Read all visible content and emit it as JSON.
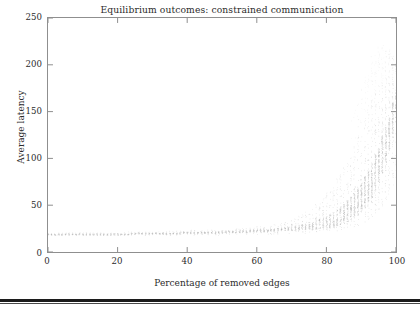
{
  "figure": {
    "title": "Equilibrium outcomes: constrained communication",
    "xlabel": "Percentage of removed edges",
    "ylabel": "Average latency"
  },
  "axes": {
    "x_ticks": [
      "0",
      "20",
      "40",
      "60",
      "80",
      "100"
    ],
    "y_ticks": [
      "0",
      "50",
      "100",
      "150",
      "200",
      "250"
    ]
  },
  "colors": {
    "marker": "#b9b9b9",
    "axis": "#8f8f8f",
    "text": "#2b2b2b",
    "background": "#ffffff",
    "page_rule": "#1c1c1c"
  },
  "chart_data": {
    "type": "scatter",
    "title": "Equilibrium outcomes: constrained communication",
    "xlabel": "Percentage of removed edges",
    "ylabel": "Average latency",
    "xlim": [
      0,
      100
    ],
    "ylim": [
      0,
      250
    ],
    "grid": false,
    "legend": null,
    "x_ticks": [
      0,
      20,
      40,
      60,
      80,
      100
    ],
    "y_ticks": [
      0,
      50,
      100,
      150,
      200,
      250
    ],
    "series": [
      {
        "name": "Average latency per instance",
        "x": [
          0,
          1,
          2,
          3,
          4,
          5,
          6,
          7,
          8,
          9,
          10,
          11,
          12,
          13,
          14,
          15,
          16,
          17,
          18,
          19,
          20,
          21,
          22,
          23,
          24,
          25,
          26,
          27,
          28,
          29,
          30,
          31,
          32,
          33,
          34,
          35,
          36,
          37,
          38,
          39,
          40,
          41,
          42,
          43,
          44,
          45,
          46,
          47,
          48,
          49,
          50,
          51,
          52,
          53,
          54,
          55,
          56,
          57,
          58,
          59,
          60,
          61,
          62,
          63,
          64,
          65,
          66,
          67,
          68,
          69,
          70,
          71,
          72,
          73,
          74,
          75,
          76,
          77,
          78,
          79,
          80,
          81,
          82,
          83,
          84,
          85,
          86,
          87,
          88,
          89,
          90,
          91,
          92,
          93,
          94,
          95,
          96,
          97,
          98,
          99,
          100
        ],
        "y_median": [
          19,
          19,
          19,
          19,
          19,
          19,
          19,
          19,
          19,
          19,
          19,
          19,
          19,
          19,
          19,
          19,
          19,
          19,
          19,
          19,
          19,
          19,
          19,
          19,
          20,
          20,
          20,
          20,
          20,
          20,
          20,
          20,
          20,
          20,
          20,
          20,
          20,
          20,
          20,
          21,
          21,
          21,
          21,
          21,
          21,
          21,
          21,
          21,
          21,
          21,
          22,
          22,
          22,
          22,
          22,
          22,
          22,
          22,
          23,
          23,
          23,
          23,
          23,
          23,
          24,
          24,
          24,
          24,
          25,
          25,
          25,
          26,
          26,
          27,
          27,
          28,
          28,
          29,
          30,
          31,
          32,
          33,
          35,
          37,
          39,
          41,
          44,
          47,
          50,
          54,
          59,
          64,
          70,
          77,
          85,
          94,
          104,
          115,
          128,
          143,
          160
        ],
        "y_low": [
          18,
          18,
          18,
          18,
          18,
          18,
          18,
          18,
          18,
          18,
          18,
          18,
          18,
          18,
          18,
          18,
          18,
          18,
          18,
          18,
          18,
          18,
          18,
          18,
          18,
          18,
          18,
          18,
          18,
          18,
          18,
          18,
          18,
          18,
          18,
          18,
          18,
          18,
          18,
          18,
          18,
          18,
          18,
          18,
          18,
          18,
          18,
          18,
          18,
          18,
          19,
          19,
          19,
          19,
          19,
          19,
          19,
          19,
          19,
          19,
          19,
          19,
          19,
          19,
          19,
          19,
          19,
          19,
          20,
          20,
          20,
          20,
          20,
          20,
          20,
          21,
          21,
          21,
          21,
          22,
          22,
          22,
          23,
          23,
          24,
          24,
          25,
          26,
          27,
          28,
          30,
          32,
          34,
          37,
          40,
          44,
          49,
          55,
          62,
          70,
          80
        ],
        "y_high": [
          21,
          21,
          21,
          21,
          21,
          21,
          21,
          21,
          21,
          21,
          21,
          21,
          21,
          21,
          21,
          21,
          21,
          21,
          21,
          21,
          21,
          21,
          21,
          22,
          22,
          22,
          22,
          22,
          22,
          22,
          22,
          22,
          22,
          23,
          23,
          23,
          23,
          23,
          23,
          23,
          23,
          24,
          24,
          24,
          24,
          24,
          24,
          24,
          25,
          25,
          25,
          25,
          25,
          26,
          26,
          26,
          26,
          27,
          27,
          27,
          28,
          28,
          29,
          29,
          30,
          30,
          31,
          32,
          33,
          34,
          35,
          37,
          39,
          41,
          43,
          46,
          49,
          52,
          56,
          60,
          64,
          69,
          74,
          80,
          86,
          93,
          100,
          108,
          116,
          125,
          134,
          144,
          154,
          163,
          170,
          176,
          180,
          183,
          185,
          186,
          187
        ]
      }
    ]
  }
}
